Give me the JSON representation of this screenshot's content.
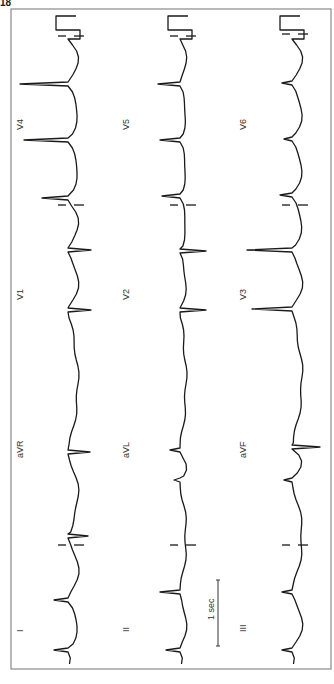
{
  "figure": {
    "corner_label": "18",
    "scale_bar_label": "1 sec",
    "frame": {
      "x": 11,
      "y": 9,
      "w": 320,
      "h": 660
    },
    "colors": {
      "trace": "#1a1a1a",
      "frame": "#8a8a8a",
      "background": "#ffffff"
    }
  },
  "chart_data": {
    "type": "line",
    "xlabel": "time (1 sec scale bar)",
    "ylabel": "amplitude",
    "layout": "3 rows x 4 columns, displayed rotated; time runs bottom-to-top",
    "grid": false,
    "leads": [
      {
        "name": "I",
        "row": 0,
        "col": 0
      },
      {
        "name": "aVR",
        "row": 0,
        "col": 1
      },
      {
        "name": "V1",
        "row": 0,
        "col": 2
      },
      {
        "name": "V4",
        "row": 0,
        "col": 3
      },
      {
        "name": "II",
        "row": 1,
        "col": 0
      },
      {
        "name": "aVL",
        "row": 1,
        "col": 1
      },
      {
        "name": "V2",
        "row": 1,
        "col": 2
      },
      {
        "name": "V5",
        "row": 1,
        "col": 3
      },
      {
        "name": "III",
        "row": 2,
        "col": 0
      },
      {
        "name": "aVF",
        "row": 2,
        "col": 1
      },
      {
        "name": "V3",
        "row": 2,
        "col": 2
      },
      {
        "name": "V6",
        "row": 2,
        "col": 3
      }
    ],
    "scale_bar": {
      "label": "1 sec",
      "length_px": 66
    }
  },
  "rows": [
    {
      "baseline_x": 68,
      "labels": [
        {
          "text": "I",
          "x": 17,
          "y": 632
        },
        {
          "text": "aVR",
          "x": 17,
          "y": 458
        },
        {
          "text": "V1",
          "x": 17,
          "y": 300
        },
        {
          "text": "V4",
          "x": 17,
          "y": 130
        }
      ],
      "qrs": [
        {
          "y": 600,
          "amp": -14
        },
        {
          "y": 650,
          "amp": -14
        },
        {
          "y": 452,
          "amp": 22
        },
        {
          "y": 536,
          "amp": 20
        },
        {
          "y": 250,
          "amp": 23
        },
        {
          "y": 310,
          "amp": 23
        },
        {
          "y": 198,
          "amp": -26
        },
        {
          "y": 84,
          "amp": -48
        },
        {
          "y": 140,
          "amp": -44
        }
      ],
      "seps": [
        {
          "y": 545
        },
        {
          "y": 205
        },
        {
          "y": 36
        }
      ]
    },
    {
      "baseline_x": 180,
      "labels": [
        {
          "text": "II",
          "x": 123,
          "y": 632
        },
        {
          "text": "aVL",
          "x": 123,
          "y": 458
        },
        {
          "text": "V2",
          "x": 123,
          "y": 300
        },
        {
          "text": "V5",
          "x": 123,
          "y": 130
        }
      ],
      "qrs": [
        {
          "y": 592,
          "amp": -20
        },
        {
          "y": 650,
          "amp": -14
        },
        {
          "y": 450,
          "amp": -10
        },
        {
          "y": 480,
          "amp": -6
        },
        {
          "y": 251,
          "amp": 26
        },
        {
          "y": 310,
          "amp": 26
        },
        {
          "y": 196,
          "amp": -18
        },
        {
          "y": 84,
          "amp": -22
        },
        {
          "y": 140,
          "amp": -20
        }
      ],
      "seps": [
        {
          "y": 545
        },
        {
          "y": 205
        },
        {
          "y": 36
        }
      ]
    },
    {
      "baseline_x": 292,
      "labels": [
        {
          "text": "III",
          "x": 240,
          "y": 632
        },
        {
          "text": "aVF",
          "x": 240,
          "y": 458
        },
        {
          "text": "V3",
          "x": 240,
          "y": 300
        },
        {
          "text": "V6",
          "x": 240,
          "y": 130
        }
      ],
      "qrs": [
        {
          "y": 592,
          "amp": -10
        },
        {
          "y": 650,
          "amp": -10
        },
        {
          "y": 447,
          "amp": 28
        },
        {
          "y": 480,
          "amp": -8
        },
        {
          "y": 250,
          "amp": -45
        },
        {
          "y": 309,
          "amp": -40
        },
        {
          "y": 195,
          "amp": -12
        },
        {
          "y": 83,
          "amp": -10
        },
        {
          "y": 139,
          "amp": -8
        }
      ],
      "seps": [
        {
          "y": 545
        },
        {
          "y": 205
        },
        {
          "y": 34
        }
      ]
    }
  ]
}
